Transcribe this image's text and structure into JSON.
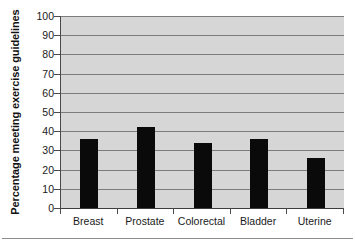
{
  "chart_data": {
    "type": "bar",
    "title": "",
    "xlabel": "",
    "ylabel": "Percentage meeting exercise guidelines",
    "categories": [
      "Breast",
      "Prostate",
      "Colorectal",
      "Bladder",
      "Uterine"
    ],
    "values": [
      36,
      42,
      34,
      36,
      26
    ],
    "ylim": [
      0,
      100
    ],
    "ytick_labels": [
      "0",
      "10",
      "20",
      "30",
      "40",
      "50",
      "60",
      "70",
      "80",
      "90",
      "100"
    ],
    "ytick_values": [
      0,
      10,
      20,
      30,
      40,
      50,
      60,
      70,
      80,
      90,
      100
    ],
    "grid": true,
    "legend": false,
    "legend_position": "none",
    "series": [
      {
        "name": "Percentage meeting exercise guidelines",
        "values": [
          36,
          42,
          34,
          36,
          26
        ]
      }
    ],
    "colors": {
      "bar": "#0a0a0a",
      "plot_background": "#d6d6d6",
      "gridline": "#7c7c7c",
      "axis": "#3d3d3d",
      "text": "#1a1a1a",
      "page_background": "#ffffff",
      "footer_rule": "#8e8e8e"
    }
  }
}
